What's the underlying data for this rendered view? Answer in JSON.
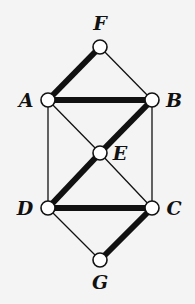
{
  "diagram": {
    "type": "graph",
    "colors": {
      "background": "#f4f4f4",
      "edge": "#111111",
      "node_fill": "#ffffff"
    },
    "nodes": [
      {
        "id": "F",
        "label": "F",
        "x": 100,
        "y": 47,
        "lx": 100,
        "ly": 30,
        "anchor": "middle"
      },
      {
        "id": "A",
        "label": "A",
        "x": 48,
        "y": 100,
        "lx": 26,
        "ly": 107,
        "anchor": "middle"
      },
      {
        "id": "B",
        "label": "B",
        "x": 152,
        "y": 100,
        "lx": 174,
        "ly": 107,
        "anchor": "middle"
      },
      {
        "id": "E",
        "label": "E",
        "x": 100,
        "y": 153,
        "lx": 120,
        "ly": 160,
        "anchor": "middle"
      },
      {
        "id": "D",
        "label": "D",
        "x": 48,
        "y": 208,
        "lx": 25,
        "ly": 215,
        "anchor": "middle"
      },
      {
        "id": "C",
        "label": "C",
        "x": 152,
        "y": 208,
        "lx": 174,
        "ly": 215,
        "anchor": "middle"
      },
      {
        "id": "G",
        "label": "G",
        "x": 100,
        "y": 260,
        "lx": 100,
        "ly": 289,
        "anchor": "middle"
      }
    ],
    "edges": [
      {
        "from": "F",
        "to": "B",
        "thick": false
      },
      {
        "from": "A",
        "to": "E",
        "thick": false
      },
      {
        "from": "A",
        "to": "D",
        "thick": false
      },
      {
        "from": "B",
        "to": "C",
        "thick": false
      },
      {
        "from": "E",
        "to": "C",
        "thick": false
      },
      {
        "from": "D",
        "to": "G",
        "thick": false
      },
      {
        "from": "F",
        "to": "A",
        "thick": true
      },
      {
        "from": "A",
        "to": "B",
        "thick": true
      },
      {
        "from": "B",
        "to": "E",
        "thick": true
      },
      {
        "from": "E",
        "to": "D",
        "thick": true
      },
      {
        "from": "D",
        "to": "C",
        "thick": true
      },
      {
        "from": "C",
        "to": "G",
        "thick": true
      }
    ]
  }
}
